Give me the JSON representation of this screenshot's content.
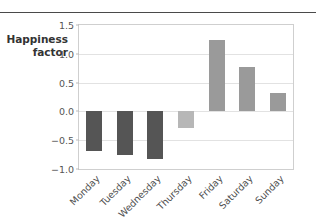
{
  "figure": {
    "axis_label_line1": "Happiness",
    "axis_label_line2": "factor"
  },
  "colors": {
    "bar_dark": "#555555",
    "bar_light": "#b7b7b7",
    "bar_medium": "#9a9a9a",
    "gridline": "#e2e2e2",
    "plot_border": "#cfcfcf",
    "top_rule": "#4a4a4a",
    "tick_text": "#555555",
    "axis_label_text": "#333333"
  },
  "chart_data": {
    "type": "bar",
    "title": "",
    "xlabel": "",
    "ylabel": "Happiness factor",
    "categories": [
      "Monday",
      "Tuesday",
      "Wednesday",
      "Thursday",
      "Friday",
      "Saturday",
      "Sunday"
    ],
    "values": [
      -0.68,
      -0.75,
      -0.83,
      -0.28,
      1.24,
      0.77,
      0.32
    ],
    "bar_colors": [
      "#555555",
      "#555555",
      "#555555",
      "#b7b7b7",
      "#9a9a9a",
      "#9a9a9a",
      "#9a9a9a"
    ],
    "ylim": [
      -1.0,
      1.5
    ],
    "yticks": [
      1.5,
      1.0,
      0.5,
      0.0,
      -0.5,
      -1.0
    ],
    "ytick_labels": [
      "1.5",
      "1.0",
      "0.5",
      "0.0",
      "−0.5",
      "−1.0"
    ],
    "gridlines_y": [
      1.0,
      0.5,
      0.0,
      -0.5
    ],
    "grid": true,
    "legend": "none",
    "xtick_rotation": -45
  }
}
